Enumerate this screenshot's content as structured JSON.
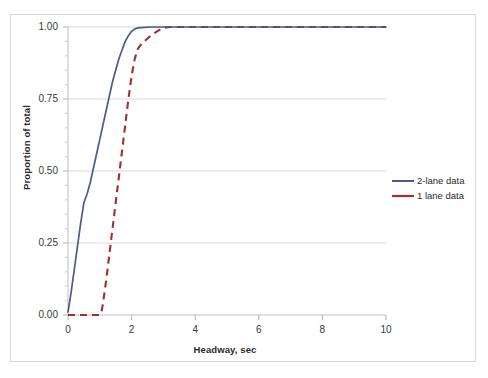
{
  "chart_data": {
    "type": "line",
    "title": "",
    "xlabel": "Headway, sec",
    "ylabel": "Proportion of total",
    "xlim": [
      0,
      10
    ],
    "ylim": [
      0.0,
      1.0
    ],
    "grid": "horizontal",
    "legend_position": "right",
    "x_ticks": [
      "0",
      "2",
      "4",
      "6",
      "8",
      "10"
    ],
    "x_tick_values": [
      0,
      2,
      4,
      6,
      8,
      10
    ],
    "y_ticks": [
      "0.00",
      "0.25",
      "0.50",
      "0.75",
      "1.00"
    ],
    "y_tick_values": [
      0.0,
      0.25,
      0.5,
      0.75,
      1.0
    ],
    "series": [
      {
        "name": "2-lane data",
        "color": "#4A5B8C",
        "style": "solid",
        "x": [
          0.0,
          0.1,
          0.2,
          0.3,
          0.4,
          0.5,
          0.6,
          0.7,
          0.8,
          0.9,
          1.0,
          1.1,
          1.2,
          1.3,
          1.4,
          1.5,
          1.6,
          1.7,
          1.8,
          1.9,
          2.0,
          2.1,
          2.2,
          2.4,
          2.6,
          3.0,
          4.0,
          6.0,
          8.0,
          10.0
        ],
        "values": [
          0.01,
          0.08,
          0.16,
          0.24,
          0.32,
          0.39,
          0.42,
          0.46,
          0.51,
          0.56,
          0.61,
          0.66,
          0.71,
          0.76,
          0.81,
          0.85,
          0.89,
          0.92,
          0.95,
          0.97,
          0.985,
          0.993,
          0.997,
          0.999,
          1.0,
          1.0,
          1.0,
          1.0,
          1.0,
          1.0
        ]
      },
      {
        "name": "1 lane data",
        "color": "#A0302A",
        "style": "dashed",
        "x": [
          0.0,
          0.2,
          0.4,
          0.6,
          0.8,
          1.0,
          1.05,
          1.1,
          1.2,
          1.3,
          1.4,
          1.5,
          1.6,
          1.7,
          1.8,
          1.9,
          2.0,
          2.1,
          2.2,
          2.3,
          2.4,
          2.5,
          2.6,
          2.8,
          3.0,
          3.2,
          4.0,
          6.0,
          8.0,
          10.0
        ],
        "values": [
          0.0,
          0.0,
          0.0,
          0.0,
          0.0,
          0.0,
          0.01,
          0.04,
          0.12,
          0.21,
          0.3,
          0.39,
          0.48,
          0.57,
          0.66,
          0.75,
          0.83,
          0.89,
          0.925,
          0.94,
          0.95,
          0.96,
          0.97,
          0.985,
          0.997,
          1.0,
          1.0,
          1.0,
          1.0,
          1.0
        ]
      }
    ]
  },
  "axes": {
    "y_title": "Proportion of total",
    "x_title": "Headway, sec",
    "y_labels": [
      "1.00",
      "0.75",
      "0.50",
      "0.25",
      "0.00"
    ],
    "x_labels": [
      "0",
      "2",
      "4",
      "6",
      "8",
      "10"
    ]
  },
  "legend": {
    "items": [
      {
        "label": "2-lane data",
        "color": "#4A5B8C",
        "style": "solid"
      },
      {
        "label": "1 lane data",
        "color": "#A0302A",
        "style": "dashed"
      }
    ]
  },
  "colors": {
    "series_2lane": "#4A5B8C",
    "series_1lane": "#A0302A",
    "gridline": "#d9d9d9",
    "axis": "#bfbfbf",
    "text": "#2b2b2b",
    "background": "#ffffff"
  }
}
